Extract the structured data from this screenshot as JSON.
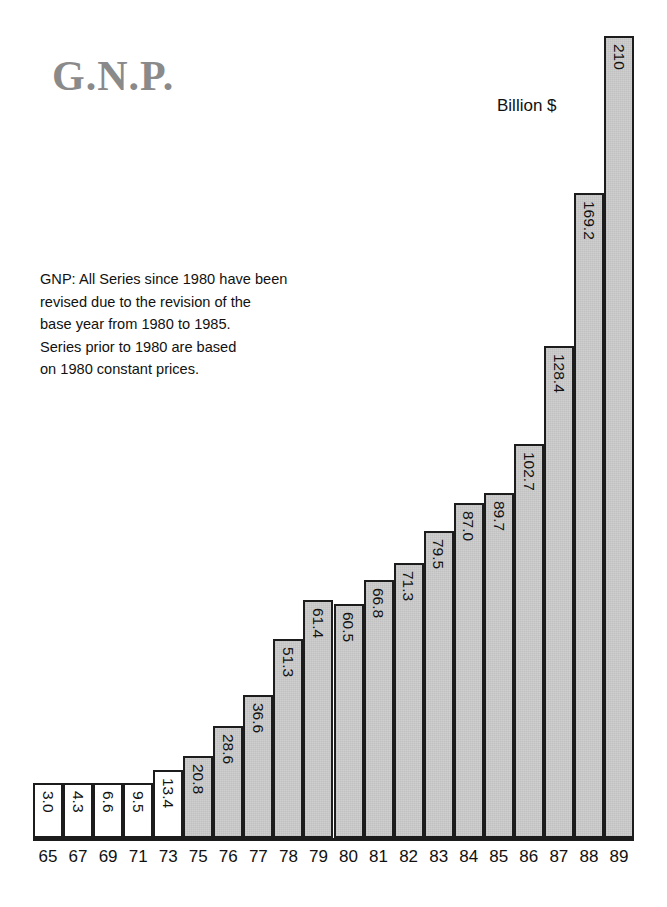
{
  "title": "G.N.P.",
  "unit_label": "Billion $",
  "note": {
    "lines": [
      "GNP: All Series since 1980 have been",
      "revised due to the  revision of the",
      "base year from 1980 to 1985.",
      "Series prior to 1980 are based",
      "on 1980 constant prices."
    ]
  },
  "colors": {
    "bar_fill": "#cfcfcf",
    "bar_border": "#1c1c1c",
    "title_color": "#8a8a8a",
    "text_color": "#111111",
    "background": "#ffffff"
  },
  "chart_data": {
    "type": "bar",
    "title": "G.N.P.",
    "xlabel": "",
    "ylabel": "Billion $",
    "ylim": [
      0,
      210
    ],
    "grid": false,
    "legend": "none",
    "annotations": [
      "Billion $",
      "GNP: All Series since 1980 have been revised due to the  revision of the base year from 1980 to 1985. Series prior to 1980 are based on 1980 constant prices."
    ],
    "categories": [
      "65",
      "67",
      "69",
      "71",
      "73",
      "75",
      "76",
      "77",
      "78",
      "79",
      "80",
      "81",
      "82",
      "83",
      "84",
      "85",
      "86",
      "87",
      "88",
      "89"
    ],
    "values": [
      3.0,
      4.3,
      6.6,
      9.5,
      13.4,
      20.8,
      28.6,
      36.6,
      51.3,
      61.4,
      60.5,
      66.8,
      71.3,
      79.5,
      87.0,
      89.7,
      102.7,
      128.4,
      169.2,
      210
    ],
    "value_labels": [
      "3.0",
      "4.3",
      "6.6",
      "9.5",
      "13.4",
      "20.8",
      "28.6",
      "36.6",
      "51.3",
      "61.4",
      "60.5",
      "66.8",
      "71.3",
      "79.5",
      "87.0",
      "89.7",
      "102.7",
      "128.4",
      "169.2",
      "210"
    ],
    "bar_styles": [
      "unfilled",
      "unfilled",
      "unfilled",
      "unfilled",
      "unfilled",
      "filled",
      "filled",
      "filled",
      "filled",
      "filled",
      "filled",
      "filled",
      "filled",
      "filled",
      "filled",
      "filled",
      "filled",
      "filled",
      "filled",
      "filled"
    ],
    "drawn_pixel_heights": [
      55,
      55,
      55,
      55,
      68,
      82,
      112,
      143,
      199,
      238,
      234,
      258,
      275,
      307,
      335,
      345,
      394,
      492,
      645,
      802
    ]
  }
}
